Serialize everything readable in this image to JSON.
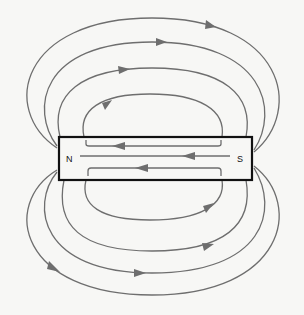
{
  "diagram": {
    "colors": {
      "background": "#f7f7f5",
      "field_line": "#6e6e6e",
      "magnet_outline": "#111111",
      "label": "#111111"
    },
    "magnet": {
      "x": 59,
      "y": 137,
      "width": 193,
      "height": 43,
      "north_label": "N",
      "south_label": "S"
    },
    "field_lines_outside": {
      "top_arcs": 4,
      "bottom_arcs": 4,
      "direction": "N to S (clockwise over top, left-to-right)"
    },
    "field_lines_inside": {
      "count": 3,
      "direction": "S to N (right-to-left)"
    }
  }
}
